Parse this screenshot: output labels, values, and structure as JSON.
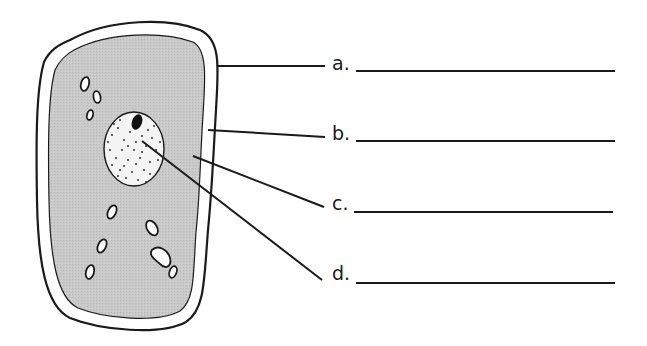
{
  "diagram": {
    "colors": {
      "cytoplasm_fill": "#c8c8c8",
      "wall_fill": "#ffffff",
      "nucleus_fill": "#f4f4f4",
      "stroke": "#1a1a1a"
    },
    "labels": [
      {
        "letter": "a.",
        "answer": "",
        "points_to": "cell wall"
      },
      {
        "letter": "b.",
        "answer": "",
        "points_to": "cell membrane"
      },
      {
        "letter": "c.",
        "answer": "",
        "points_to": "cytoplasm"
      },
      {
        "letter": "d.",
        "answer": "",
        "points_to": "nucleus"
      }
    ]
  }
}
